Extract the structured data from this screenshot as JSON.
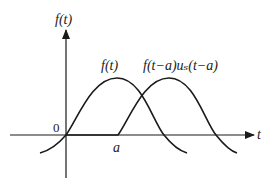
{
  "diagram": {
    "y_axis_label": "f(t)",
    "x_axis_label": "t",
    "origin_label": "0",
    "shift_label": "a",
    "curves": [
      {
        "name": "original",
        "label": "f(t)"
      },
      {
        "name": "shifted",
        "label": "f(t−a)uₛ(t−a)"
      }
    ],
    "colors": {
      "stroke": "#1a1a1a",
      "background": "#ffffff"
    }
  }
}
